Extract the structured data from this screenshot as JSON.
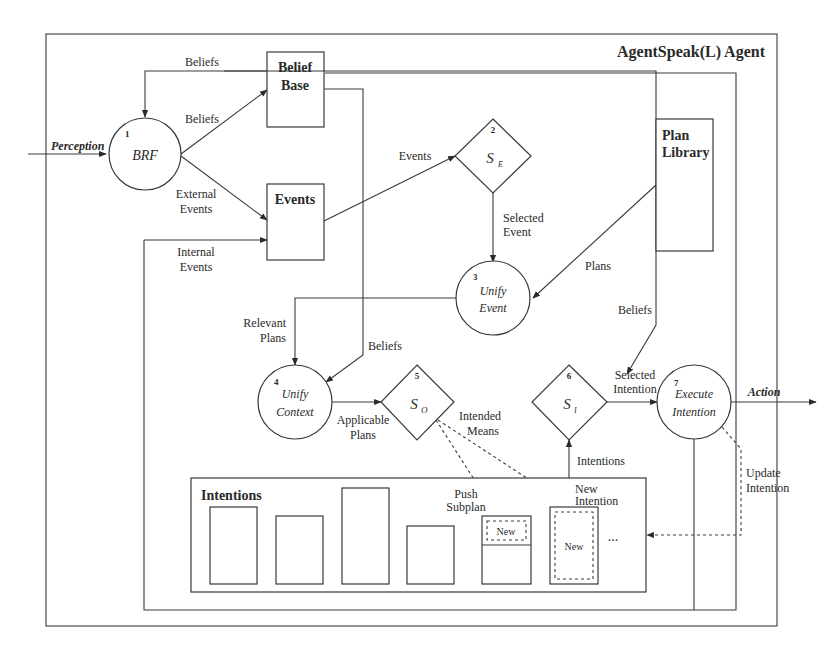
{
  "diagram": {
    "title": "AgentSpeak(L) Agent",
    "external": {
      "perception": "Perception",
      "action": "Action"
    },
    "nodes": {
      "brf": {
        "number": "1",
        "label": "BRF"
      },
      "belief_base": {
        "label_line1": "Belief",
        "label_line2": "Base"
      },
      "events": {
        "label": "Events"
      },
      "select_event": {
        "number": "2",
        "symbol": "S",
        "subscript": "E"
      },
      "plan_library": {
        "label_line1": "Plan",
        "label_line2": "Library"
      },
      "unify_event": {
        "number": "3",
        "label_line1": "Unify",
        "label_line2": "Event"
      },
      "unify_context": {
        "number": "4",
        "label_line1": "Unify",
        "label_line2": "Context"
      },
      "select_option": {
        "number": "5",
        "symbol": "S",
        "subscript": "O"
      },
      "select_intention": {
        "number": "6",
        "symbol": "S",
        "subscript": "I"
      },
      "execute_intention": {
        "number": "7",
        "label_line1": "Execute",
        "label_line2": "Intention"
      },
      "intentions": {
        "label": "Intentions",
        "new_label": "New",
        "ellipsis": "..."
      }
    },
    "edges": {
      "beliefs_top": "Beliefs",
      "beliefs_brf_to_bb": "Beliefs",
      "external_events_line1": "External",
      "external_events_line2": "Events",
      "internal_events_line1": "Internal",
      "internal_events_line2": "Events",
      "events_to_se": "Events",
      "selected_event_line1": "Selected",
      "selected_event_line2": "Event",
      "plans": "Plans",
      "relevant_plans_line1": "Relevant",
      "relevant_plans_line2": "Plans",
      "beliefs_to_context": "Beliefs",
      "applicable_plans_line1": "Applicable",
      "applicable_plans_line2": "Plans",
      "intended_means_line1": "Intended",
      "intended_means_line2": "Means",
      "push_subplan_line1": "Push",
      "push_subplan_line2": "Subplan",
      "new_intention_line1": "New",
      "new_intention_line2": "Intention",
      "intentions": "Intentions",
      "selected_intention_line1": "Selected",
      "selected_intention_line2": "Intention",
      "beliefs_to_execute": "Beliefs",
      "update_intention_line1": "Update",
      "update_intention_line2": "Intention"
    }
  }
}
